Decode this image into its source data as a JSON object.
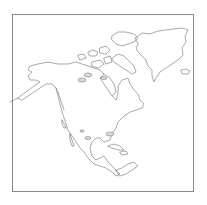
{
  "map": {
    "type": "outline-map",
    "region": "North America",
    "colors": {
      "background": "#ffffff",
      "coastline": "#6e6e6e",
      "frame": "#8a8a8a",
      "water_bodies": "#d9d9d9"
    },
    "labels": []
  }
}
